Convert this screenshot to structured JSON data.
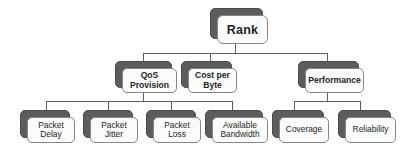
{
  "diagram": {
    "title": "Rank",
    "type": "hierarchy-tree",
    "colors": {
      "card_front": "#fbfbfb",
      "card_back": "#5d5d5d",
      "card_border": "#868686",
      "line": "#5e5e5e",
      "text": "#1e1e1e",
      "background": "#ffffff"
    },
    "nodes": {
      "root": {
        "label": "Rank"
      },
      "level1": [
        {
          "label": "QoS\nProvision"
        },
        {
          "label": "Cost per\nByte"
        },
        {
          "label": "Performance"
        }
      ],
      "qos_children": [
        {
          "label": "Packet\nDelay"
        },
        {
          "label": "Packet\nJitter"
        },
        {
          "label": "Packet\nLoss"
        },
        {
          "label": "Available\nBandwidth"
        }
      ],
      "performance_children": [
        {
          "label": "Coverage"
        },
        {
          "label": "Reliability"
        }
      ]
    }
  }
}
